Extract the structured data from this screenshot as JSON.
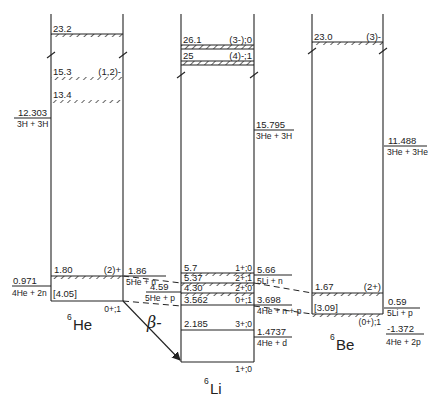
{
  "nuclei": [
    {
      "id": "he6",
      "label_mass": "6",
      "label_symbol": "He",
      "ground_state": "0+;1",
      "levels": [
        {
          "energy": "23.2",
          "jpi": "",
          "broad": true
        },
        {
          "energy": "15.3",
          "jpi": "(1,2)-",
          "broad": true
        },
        {
          "energy": "13.4",
          "jpi": "",
          "broad": true
        },
        {
          "energy": "1.80",
          "jpi": "(2)+",
          "broad": true
        }
      ],
      "thresholds": [
        {
          "energy": "12.303",
          "channel": "3H + 3H"
        },
        {
          "energy": "0.971",
          "channel": "4He + 2n"
        }
      ],
      "box_label": "[4.05]"
    },
    {
      "id": "li6",
      "label_mass": "6",
      "label_symbol": "Li",
      "ground_state": "1+;0",
      "levels": [
        {
          "energy": "26.1",
          "jpi": "(3-);0",
          "broad": true
        },
        {
          "energy": "25",
          "jpi": "(4)-;1",
          "broad": true
        },
        {
          "energy": "5.7",
          "jpi": "1+;0",
          "broad": true
        },
        {
          "energy": "5.37",
          "jpi": "2+;1",
          "broad": true
        },
        {
          "energy": "4.30",
          "jpi": "2+;0",
          "broad": true
        },
        {
          "energy": "3.562",
          "jpi": "0+;1",
          "broad": false
        },
        {
          "energy": "2.185",
          "jpi": "3+;0",
          "broad": false
        }
      ],
      "thresholds": [
        {
          "energy": "15.795",
          "channel": "3He + 3H"
        },
        {
          "energy": "5.66",
          "channel": "5Li + n"
        },
        {
          "energy": "3.698",
          "channel": "4He + n + p"
        },
        {
          "energy": "1.4737",
          "channel": "4He + d"
        }
      ],
      "left_thresholds": [
        {
          "energy": "1.86",
          "channel": "5He + n"
        },
        {
          "energy": "4.59",
          "channel": "5He + p"
        }
      ]
    },
    {
      "id": "be6",
      "label_mass": "6",
      "label_symbol": "Be",
      "ground_state": "(0+);1",
      "levels": [
        {
          "energy": "23.0",
          "jpi": "(3)-",
          "broad": true
        },
        {
          "energy": "1.67",
          "jpi": "(2+)",
          "broad": true
        }
      ],
      "thresholds": [
        {
          "energy": "11.488",
          "channel": "3He + 3He"
        },
        {
          "energy": "0.59",
          "channel": "5Li + p"
        },
        {
          "energy": "-1.372",
          "channel": "4He + 2p"
        }
      ],
      "box_label": "[3.09]"
    }
  ],
  "decay": {
    "label": "β-"
  }
}
